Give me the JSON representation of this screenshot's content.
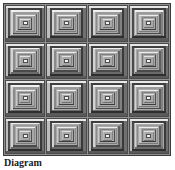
{
  "figure": {
    "title": "Diagram",
    "caption": "Diagram",
    "kind": "quilt-block-diagram",
    "pattern_name": "Log Cabin / Courthouse Steps",
    "grid": {
      "rows": 4,
      "columns": 4,
      "total_blocks": 16
    },
    "border_color": "#3a3a3a",
    "background_color": "#8f8f8f",
    "sashing_color": "#8f8f8f"
  },
  "block": {
    "name": "log-cabin-block",
    "ring_count": 7,
    "center_color": "#f2f2f2",
    "center_border_color": "#4f4f4f",
    "rings": [
      {
        "index": 0,
        "top": "#e8e8e8",
        "bottom": "#5a5a5a",
        "left": "#bdbdbd",
        "right": "#707070"
      },
      {
        "index": 1,
        "top": "#3f3f3f",
        "bottom": "#2e2e2e",
        "left": "#4a4a4a",
        "right": "#3a3a3a"
      },
      {
        "index": 2,
        "top": "#f0f0f0",
        "bottom": "#6b6b6b",
        "left": "#d2d2d2",
        "right": "#828282"
      },
      {
        "index": 3,
        "top": "#9a9a9a",
        "bottom": "#4a4a4a",
        "left": "#8a8a8a",
        "right": "#5e5e5e"
      },
      {
        "index": 4,
        "top": "#ededed",
        "bottom": "#7a7a7a",
        "left": "#c8c8c8",
        "right": "#8e8e8e"
      },
      {
        "index": 5,
        "top": "#808080",
        "bottom": "#3c3c3c",
        "left": "#777777",
        "right": "#4e4e4e"
      },
      {
        "index": 6,
        "top": "#e2e2e2",
        "bottom": "#6f6f6f",
        "left": "#b8b8b8",
        "right": "#858585"
      }
    ]
  },
  "blocks": [
    {
      "id": 1,
      "row": 1,
      "col": 1,
      "label": "block-r1c1"
    },
    {
      "id": 2,
      "row": 1,
      "col": 2,
      "label": "block-r1c2"
    },
    {
      "id": 3,
      "row": 1,
      "col": 3,
      "label": "block-r1c3"
    },
    {
      "id": 4,
      "row": 1,
      "col": 4,
      "label": "block-r1c4"
    },
    {
      "id": 5,
      "row": 2,
      "col": 1,
      "label": "block-r2c1"
    },
    {
      "id": 6,
      "row": 2,
      "col": 2,
      "label": "block-r2c2"
    },
    {
      "id": 7,
      "row": 2,
      "col": 3,
      "label": "block-r2c3"
    },
    {
      "id": 8,
      "row": 2,
      "col": 4,
      "label": "block-r2c4"
    },
    {
      "id": 9,
      "row": 3,
      "col": 1,
      "label": "block-r3c1"
    },
    {
      "id": 10,
      "row": 3,
      "col": 2,
      "label": "block-r3c2"
    },
    {
      "id": 11,
      "row": 3,
      "col": 3,
      "label": "block-r3c3"
    },
    {
      "id": 12,
      "row": 3,
      "col": 4,
      "label": "block-r3c4"
    },
    {
      "id": 13,
      "row": 4,
      "col": 1,
      "label": "block-r4c1"
    },
    {
      "id": 14,
      "row": 4,
      "col": 2,
      "label": "block-r4c2"
    },
    {
      "id": 15,
      "row": 4,
      "col": 3,
      "label": "block-r4c3"
    },
    {
      "id": 16,
      "row": 4,
      "col": 4,
      "label": "block-r4c4"
    }
  ]
}
